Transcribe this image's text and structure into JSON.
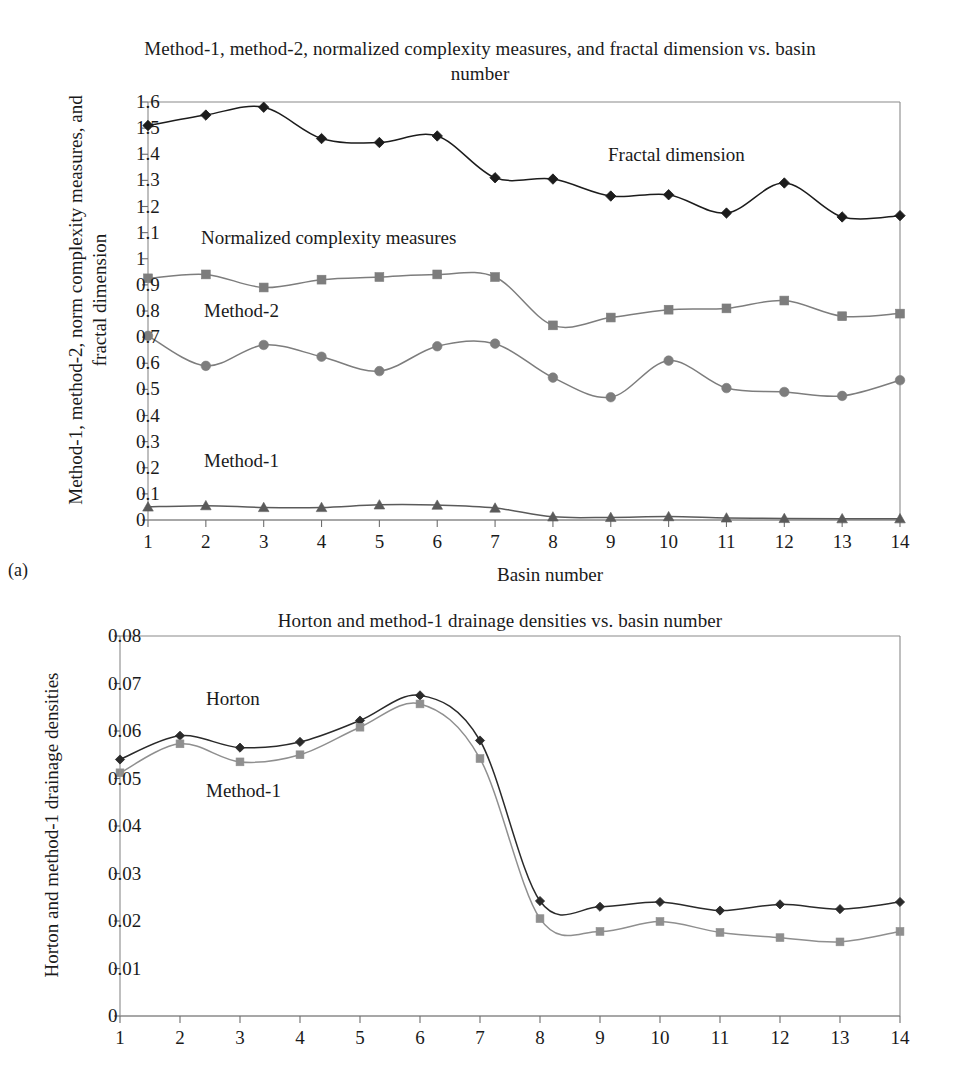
{
  "figure_a": {
    "subfigure_label": "(a)",
    "title": "Method-1, method-2, normalized complexity measures, and fractal dimension vs. basin number",
    "ylabel": "Method-1, method-2, norm complexity measures, and fractal dimension",
    "xlabel": "Basin number",
    "annotations": {
      "fractal": "Fractal dimension",
      "normalized": "Normalized complexity measures",
      "method2": "Method-2",
      "method1": "Method-1"
    }
  },
  "figure_b": {
    "title": "Horton and method-1 drainage densities vs. basin number",
    "ylabel": "Horton and method-1 drainage densities",
    "annotations": {
      "horton": "Horton",
      "method1": "Method-1"
    }
  },
  "colors": {
    "fractal": "#1c1c1c",
    "normalized": "#7d7d7d",
    "method2": "#7d7d7d",
    "method1": "#5a5a5a",
    "horton": "#2a2a2a",
    "method1_b": "#8f8f8f",
    "axis": "#8a8a8a",
    "text": "#1a1a1a"
  },
  "chart_data": [
    {
      "id": "chart-a",
      "type": "line",
      "title": "Method-1, method-2, normalized complexity measures, and fractal dimension vs. basin number",
      "xlabel": "Basin number",
      "ylabel": "Method-1, method-2, norm complexity measures, and fractal dimension",
      "x": [
        1,
        2,
        3,
        4,
        5,
        6,
        7,
        8,
        9,
        10,
        11,
        12,
        13,
        14
      ],
      "xticklabels": [
        "1",
        "2",
        "3",
        "4",
        "5",
        "6",
        "7",
        "8",
        "9",
        "10",
        "11",
        "12",
        "13",
        "14"
      ],
      "yticklabels": [
        "0",
        "0.1",
        "0.2",
        "0.3",
        "0.4",
        "0.5",
        "0.6",
        "0.7",
        "0.8",
        "0.9",
        "1",
        "1.1",
        "1.2",
        "1.3",
        "1.4",
        "1.5",
        "1.6"
      ],
      "ylim": [
        0,
        1.6
      ],
      "xlim": [
        1,
        14
      ],
      "grid": false,
      "legend": "inline-annotations",
      "series": [
        {
          "name": "Fractal dimension",
          "marker": "diamond",
          "color": "#1c1c1c",
          "values": [
            1.51,
            1.55,
            1.58,
            1.46,
            1.445,
            1.47,
            1.31,
            1.305,
            1.24,
            1.245,
            1.175,
            1.29,
            1.16,
            1.165
          ]
        },
        {
          "name": "Normalized complexity measures",
          "marker": "square",
          "color": "#7d7d7d",
          "values": [
            0.925,
            0.94,
            0.89,
            0.92,
            0.93,
            0.94,
            0.93,
            0.745,
            0.775,
            0.805,
            0.81,
            0.84,
            0.78,
            0.79
          ]
        },
        {
          "name": "Method-2",
          "marker": "circle",
          "color": "#7d7d7d",
          "values": [
            0.705,
            0.59,
            0.67,
            0.625,
            0.57,
            0.665,
            0.675,
            0.545,
            0.47,
            0.61,
            0.505,
            0.49,
            0.475,
            0.535
          ]
        },
        {
          "name": "Method-1",
          "marker": "triangle",
          "color": "#5a5a5a",
          "values": [
            0.05,
            0.055,
            0.048,
            0.048,
            0.058,
            0.057,
            0.046,
            0.012,
            0.01,
            0.013,
            0.008,
            0.006,
            0.005,
            0.005
          ]
        }
      ]
    },
    {
      "id": "chart-b",
      "type": "line",
      "title": "Horton and method-1 drainage densities vs. basin number",
      "xlabel": "",
      "ylabel": "Horton and method-1 drainage densities",
      "x": [
        1,
        2,
        3,
        4,
        5,
        6,
        7,
        8,
        9,
        10,
        11,
        12,
        13,
        14
      ],
      "xticklabels": [
        "1",
        "2",
        "3",
        "4",
        "5",
        "6",
        "7",
        "8",
        "9",
        "10",
        "11",
        "12",
        "13",
        "14"
      ],
      "yticklabels": [
        "0",
        "0.01",
        "0.02",
        "0.03",
        "0.04",
        "0.05",
        "0.06",
        "0.07",
        "0.08"
      ],
      "ylim": [
        0,
        0.08
      ],
      "xlim": [
        1,
        14
      ],
      "grid": false,
      "legend": "inline-annotations",
      "series": [
        {
          "name": "Horton",
          "marker": "diamond",
          "color": "#2a2a2a",
          "values": [
            0.054,
            0.059,
            0.0565,
            0.0577,
            0.0622,
            0.0675,
            0.058,
            0.0242,
            0.023,
            0.024,
            0.0222,
            0.0235,
            0.0225,
            0.024
          ]
        },
        {
          "name": "Method-1",
          "marker": "square",
          "color": "#8f8f8f",
          "values": [
            0.0512,
            0.0573,
            0.0535,
            0.055,
            0.0608,
            0.0657,
            0.0542,
            0.0205,
            0.0178,
            0.0199,
            0.0176,
            0.0165,
            0.0156,
            0.0178
          ]
        }
      ]
    }
  ]
}
